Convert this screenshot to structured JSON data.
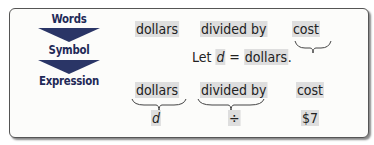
{
  "labels": {
    "words": "Words",
    "symbol": "Symbol",
    "expression": "Expression"
  },
  "words_row": {
    "dollars": "dollars",
    "divided_by": "divided by",
    "cost": "cost"
  },
  "symbol_row": {
    "let": "Let",
    "variable": "d",
    "equals": "=",
    "dollars": "dollars",
    "period": "."
  },
  "expression_row": {
    "dollars": "dollars",
    "divided_by": "divided by",
    "cost": "cost",
    "var_d": "d",
    "divide_sign": "÷",
    "cost_value": "$7"
  },
  "colors": {
    "label_text": "#1f2a57",
    "arrow": "#2a3566",
    "highlight": "#dedede"
  }
}
